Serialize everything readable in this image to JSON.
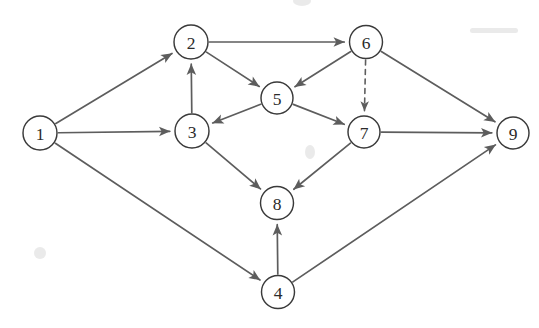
{
  "diagram": {
    "type": "directed-graph",
    "background_color": "#ffffff",
    "edge_color": "#5d5d5d",
    "node_stroke_color": "#3a3a3a",
    "node_fill_color": "#ffffff",
    "label_color": "#2b2b2b",
    "node_radius": 16.5,
    "canvas": {
      "width": 539,
      "height": 328
    },
    "nodes": [
      {
        "id": "1",
        "label": "1",
        "x": 40,
        "y": 133,
        "r": 17
      },
      {
        "id": "2",
        "label": "2",
        "x": 191,
        "y": 42,
        "r": 17
      },
      {
        "id": "3",
        "label": "3",
        "x": 192,
        "y": 131,
        "r": 17
      },
      {
        "id": "4",
        "label": "4",
        "x": 278,
        "y": 292,
        "r": 16.5
      },
      {
        "id": "5",
        "label": "5",
        "x": 277,
        "y": 98,
        "r": 16
      },
      {
        "id": "6",
        "label": "6",
        "x": 366,
        "y": 42,
        "r": 16.5
      },
      {
        "id": "7",
        "label": "7",
        "x": 364,
        "y": 132,
        "r": 16
      },
      {
        "id": "8",
        "label": "8",
        "x": 277,
        "y": 203,
        "r": 16.5
      },
      {
        "id": "9",
        "label": "9",
        "x": 513,
        "y": 133,
        "r": 16
      }
    ],
    "edges": [
      {
        "from": "1",
        "to": "2",
        "style": "solid",
        "directed": true
      },
      {
        "from": "1",
        "to": "3",
        "style": "solid",
        "directed": true
      },
      {
        "from": "1",
        "to": "4",
        "style": "solid",
        "directed": true
      },
      {
        "from": "3",
        "to": "2",
        "style": "solid",
        "directed": true
      },
      {
        "from": "2",
        "to": "6",
        "style": "solid",
        "directed": true
      },
      {
        "from": "2",
        "to": "5",
        "style": "solid",
        "directed": true
      },
      {
        "from": "6",
        "to": "5",
        "style": "solid",
        "directed": true
      },
      {
        "from": "5",
        "to": "3",
        "style": "solid",
        "directed": true
      },
      {
        "from": "5",
        "to": "7",
        "style": "solid",
        "directed": true
      },
      {
        "from": "6",
        "to": "7",
        "style": "dashed",
        "directed": true
      },
      {
        "from": "6",
        "to": "9",
        "style": "solid",
        "directed": true
      },
      {
        "from": "7",
        "to": "9",
        "style": "solid",
        "directed": true
      },
      {
        "from": "3",
        "to": "8",
        "style": "solid",
        "directed": true
      },
      {
        "from": "7",
        "to": "8",
        "style": "solid",
        "directed": true
      },
      {
        "from": "4",
        "to": "8",
        "style": "solid",
        "directed": true
      },
      {
        "from": "4",
        "to": "9",
        "style": "solid",
        "directed": true
      }
    ]
  }
}
